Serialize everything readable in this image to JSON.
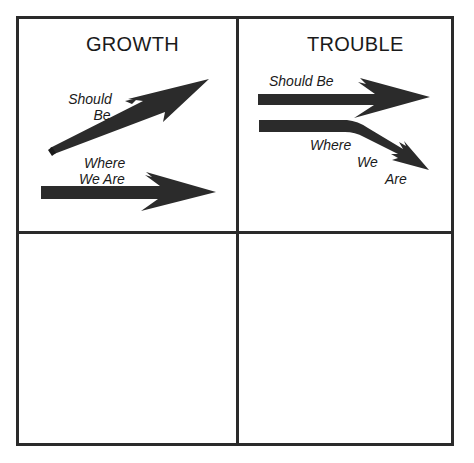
{
  "diagram": {
    "quadrants": [
      {
        "id": "top-left",
        "title": "GROWTH",
        "arrows": [
          {
            "label_line1": "Should",
            "label_line2": "Be",
            "direction": "up-right"
          },
          {
            "label_line1": "Where",
            "label_line2": "We Are",
            "direction": "right"
          }
        ]
      },
      {
        "id": "top-right",
        "title": "TROUBLE",
        "arrows": [
          {
            "label": "Should Be",
            "direction": "right"
          },
          {
            "label_line1": "Where",
            "label_line2": "We",
            "label_line3": "Are",
            "direction": "down-right"
          }
        ]
      },
      {
        "id": "bottom-left",
        "title": ""
      },
      {
        "id": "bottom-right",
        "title": ""
      }
    ],
    "colors": {
      "border": "#2a2a2a",
      "arrow": "#2b2b2b",
      "text": "#1a1a1a",
      "background": "#ffffff"
    }
  }
}
